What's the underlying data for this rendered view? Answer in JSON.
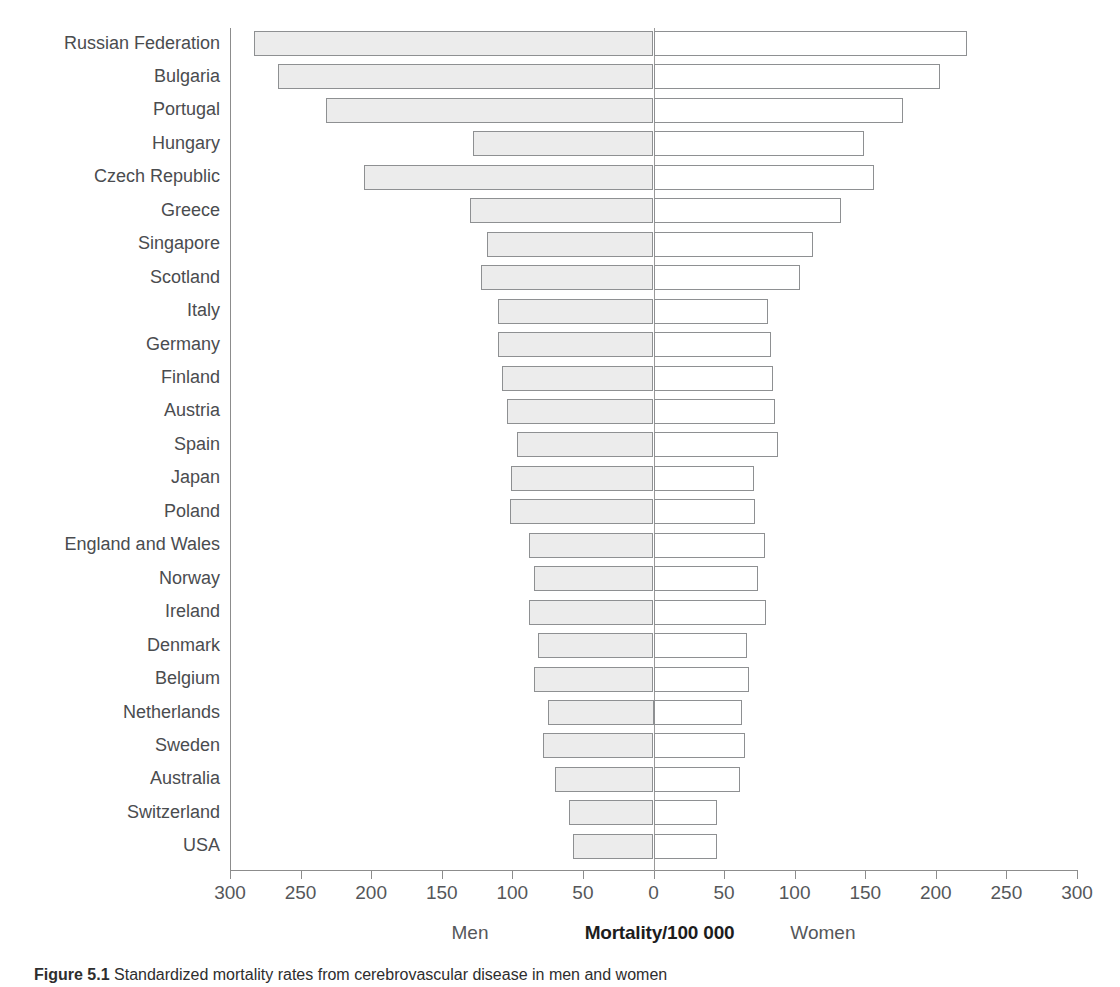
{
  "chart_data": {
    "type": "bar",
    "orientation": "horizontal",
    "style": "population-pyramid-diverging",
    "title": "",
    "xlabel": "Mortality/100 000",
    "ylabel": "",
    "left_group_label": "Men",
    "right_group_label": "Women",
    "center_label": "Mortality/100 000",
    "xlim": [
      -300,
      300
    ],
    "axis_tick_values": [
      -300,
      -250,
      -200,
      -150,
      -100,
      -50,
      0,
      50,
      100,
      150,
      200,
      250,
      300
    ],
    "axis_tick_labels": [
      "300",
      "250",
      "200",
      "150",
      "100",
      "50",
      "0",
      "50",
      "100",
      "150",
      "200",
      "250",
      "300"
    ],
    "grid": false,
    "legend": "none",
    "categories": [
      "Russian Federation",
      "Bulgaria",
      "Portugal",
      "Hungary",
      "Czech Republic",
      "Greece",
      "Singapore",
      "Scotland",
      "Italy",
      "Germany",
      "Finland",
      "Austria",
      "Spain",
      "Japan",
      "Poland",
      "England and Wales",
      "Norway",
      "Ireland",
      "Denmark",
      "Belgium",
      "Netherlands",
      "Sweden",
      "Australia",
      "Switzerland",
      "USA"
    ],
    "series": [
      {
        "name": "Men",
        "side": "left",
        "values": [
          283,
          266,
          232,
          128,
          205,
          130,
          118,
          122,
          110,
          110,
          107,
          104,
          97,
          101,
          102,
          88,
          85,
          88,
          82,
          85,
          75,
          78,
          70,
          60,
          57
        ]
      },
      {
        "name": "Women",
        "side": "right",
        "values": [
          222,
          203,
          177,
          149,
          156,
          133,
          113,
          104,
          81,
          83,
          85,
          86,
          88,
          71,
          72,
          79,
          74,
          80,
          66,
          68,
          63,
          65,
          61,
          45,
          45
        ]
      }
    ]
  },
  "caption": {
    "figure_number": "Figure 5.1",
    "text": "Standardized mortality rates from cerebrovascular disease in men and women"
  }
}
